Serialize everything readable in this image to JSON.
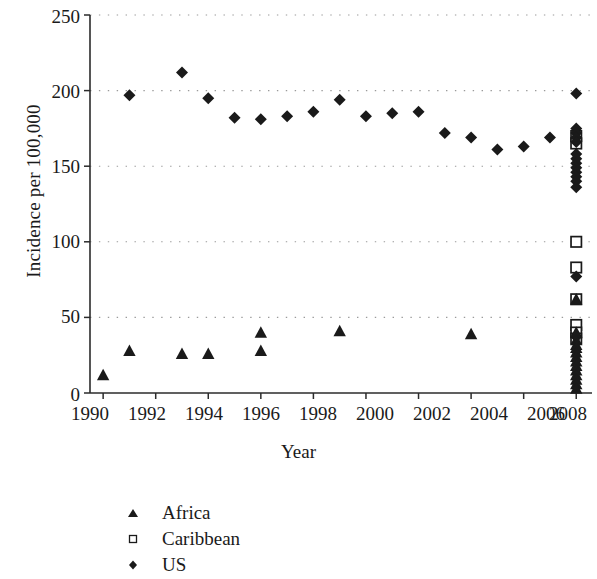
{
  "chart_data": {
    "type": "scatter",
    "title": "",
    "xlabel": "Year",
    "ylabel": "Incidence per 100,000",
    "xlim": [
      1989.5,
      2008.6
    ],
    "ylim": [
      0,
      250
    ],
    "yticks": [
      0,
      50,
      100,
      150,
      200,
      250
    ],
    "xticks": [
      1990,
      1992,
      1994,
      1996,
      1998,
      2000,
      2002,
      2004,
      2006,
      2008
    ],
    "grid": "horizontal-dotted",
    "legend_position": "below-left",
    "series": [
      {
        "name": "Africa",
        "marker": "filled-triangle",
        "color": "#1a1a1a",
        "points": [
          {
            "x": 1990,
            "y": 12
          },
          {
            "x": 1991,
            "y": 28
          },
          {
            "x": 1993,
            "y": 26
          },
          {
            "x": 1994,
            "y": 26
          },
          {
            "x": 1996,
            "y": 40
          },
          {
            "x": 1996,
            "y": 28
          },
          {
            "x": 1999,
            "y": 41
          },
          {
            "x": 2004,
            "y": 39
          },
          {
            "x": 2008,
            "y": 62
          },
          {
            "x": 2008,
            "y": 40
          },
          {
            "x": 2008,
            "y": 35
          },
          {
            "x": 2008,
            "y": 32
          },
          {
            "x": 2008,
            "y": 30
          },
          {
            "x": 2008,
            "y": 27
          },
          {
            "x": 2008,
            "y": 24
          },
          {
            "x": 2008,
            "y": 21
          },
          {
            "x": 2008,
            "y": 18
          },
          {
            "x": 2008,
            "y": 15
          },
          {
            "x": 2008,
            "y": 12
          },
          {
            "x": 2008,
            "y": 9
          },
          {
            "x": 2008,
            "y": 6
          },
          {
            "x": 2008,
            "y": 3
          }
        ]
      },
      {
        "name": "Caribbean",
        "marker": "open-square",
        "color": "#1a1a1a",
        "points": [
          {
            "x": 2008,
            "y": 170
          },
          {
            "x": 2008,
            "y": 165
          },
          {
            "x": 2008,
            "y": 100
          },
          {
            "x": 2008,
            "y": 83
          },
          {
            "x": 2008,
            "y": 62
          },
          {
            "x": 2008,
            "y": 45
          },
          {
            "x": 2008,
            "y": 40
          },
          {
            "x": 2008,
            "y": 36
          }
        ]
      },
      {
        "name": "US",
        "marker": "filled-diamond",
        "color": "#1a1a1a",
        "points": [
          {
            "x": 1991,
            "y": 197
          },
          {
            "x": 1993,
            "y": 212
          },
          {
            "x": 1994,
            "y": 195
          },
          {
            "x": 1995,
            "y": 182
          },
          {
            "x": 1996,
            "y": 181
          },
          {
            "x": 1997,
            "y": 183
          },
          {
            "x": 1998,
            "y": 186
          },
          {
            "x": 1999,
            "y": 194
          },
          {
            "x": 2000,
            "y": 183
          },
          {
            "x": 2001,
            "y": 185
          },
          {
            "x": 2002,
            "y": 186
          },
          {
            "x": 2003,
            "y": 172
          },
          {
            "x": 2004,
            "y": 169
          },
          {
            "x": 2005,
            "y": 161
          },
          {
            "x": 2006,
            "y": 163
          },
          {
            "x": 2007,
            "y": 169
          },
          {
            "x": 2008,
            "y": 198
          },
          {
            "x": 2008,
            "y": 175
          },
          {
            "x": 2008,
            "y": 172
          },
          {
            "x": 2008,
            "y": 169
          },
          {
            "x": 2008,
            "y": 166
          },
          {
            "x": 2008,
            "y": 158
          },
          {
            "x": 2008,
            "y": 155
          },
          {
            "x": 2008,
            "y": 152
          },
          {
            "x": 2008,
            "y": 149
          },
          {
            "x": 2008,
            "y": 146
          },
          {
            "x": 2008,
            "y": 143
          },
          {
            "x": 2008,
            "y": 140
          },
          {
            "x": 2008,
            "y": 136
          },
          {
            "x": 2008,
            "y": 77
          },
          {
            "x": 2008,
            "y": 37
          }
        ]
      }
    ]
  },
  "axes": {
    "y_label": "Incidence per 100,000",
    "x_label": "Year",
    "y_ticks": [
      "250",
      "200",
      "150",
      "100",
      "50",
      "0"
    ],
    "x_ticks": [
      "1990",
      "1992",
      "1994",
      "1996",
      "1998",
      "2000",
      "2002",
      "2004",
      "2006",
      "2008"
    ]
  },
  "legend": {
    "items": [
      {
        "label": "Africa",
        "marker": "triangle-up-filled"
      },
      {
        "label": "Caribbean",
        "marker": "square-open"
      },
      {
        "label": "US",
        "marker": "diamond-filled"
      }
    ]
  }
}
